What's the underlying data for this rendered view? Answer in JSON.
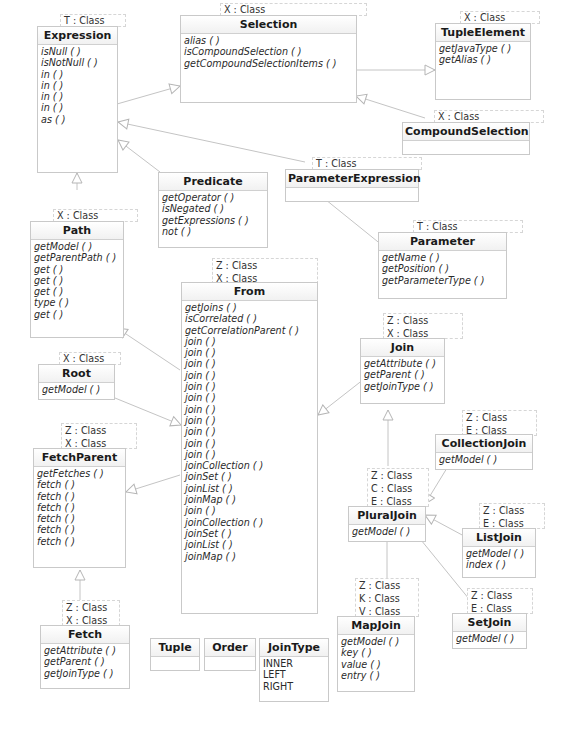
{
  "diagram": {
    "type": "UML class diagram",
    "classes": {
      "expression": {
        "name": "Expression",
        "type_params": [
          "T : Class"
        ],
        "operations": [
          "isNull ( )",
          "isNotNull ( )",
          "in ( )",
          "in ( )",
          "in ( )",
          "in ( )",
          "as ( )"
        ]
      },
      "selection": {
        "name": "Selection",
        "type_params": [
          "X : Class"
        ],
        "operations": [
          "alias ( )",
          "isCompoundSelection ( )",
          "getCompoundSelectionItems ( )"
        ]
      },
      "tuple_element": {
        "name": "TupleElement",
        "type_params": [
          "X : Class"
        ],
        "operations": [
          "getJavaType ( )",
          "getAlias ( )"
        ]
      },
      "compound_selection": {
        "name": "CompoundSelection",
        "type_params": [
          "X : Class"
        ],
        "operations": []
      },
      "parameter_expression": {
        "name": "ParameterExpression",
        "type_params": [
          "T : Class"
        ],
        "operations": []
      },
      "predicate": {
        "name": "Predicate",
        "type_params": [],
        "operations": [
          "getOperator ( )",
          "isNegated ( )",
          "getExpressions ( )",
          "not ( )"
        ]
      },
      "parameter": {
        "name": "Parameter",
        "type_params": [
          "T : Class"
        ],
        "operations": [
          "getName ( )",
          "getPosition ( )",
          "getParameterType ( )"
        ]
      },
      "path": {
        "name": "Path",
        "type_params": [
          "X : Class"
        ],
        "operations": [
          "getModel ( )",
          "getParentPath ( )",
          "get ( )",
          "get ( )",
          "get ( )",
          "type ( )",
          "get ( )"
        ]
      },
      "from": {
        "name": "From",
        "type_params": [
          "Z : Class",
          "X : Class"
        ],
        "operations": [
          "getJoins ( )",
          "isCorrelated ( )",
          "getCorrelationParent ( )",
          "join ( )",
          "join ( )",
          "join ( )",
          "join ( )",
          "join ( )",
          "join ( )",
          "join ( )",
          "join ( )",
          "join ( )",
          "join ( )",
          "join ( )",
          "joinCollection ( )",
          "joinSet ( )",
          "joinList ( )",
          "joinMap ( )",
          "join ( )",
          "joinCollection ( )",
          "joinSet ( )",
          "joinList ( )",
          "joinMap ( )"
        ]
      },
      "join": {
        "name": "Join",
        "type_params": [
          "Z : Class",
          "X : Class"
        ],
        "operations": [
          "getAttribute ( )",
          "getParent ( )",
          "getJoinType ( )"
        ]
      },
      "root": {
        "name": "Root",
        "type_params": [
          "X : Class"
        ],
        "operations": [
          "getModel ( )"
        ]
      },
      "collection_join": {
        "name": "CollectionJoin",
        "type_params": [
          "Z : Class",
          "E : Class"
        ],
        "operations": [
          "getModel ( )"
        ]
      },
      "fetch_parent": {
        "name": "FetchParent",
        "type_params": [
          "Z : Class",
          "X : Class"
        ],
        "operations": [
          "getFetches ( )",
          "fetch ( )",
          "fetch ( )",
          "fetch ( )",
          "fetch ( )",
          "fetch ( )",
          "fetch ( )"
        ]
      },
      "plural_join": {
        "name": "PluralJoin",
        "type_params": [
          "Z : Class",
          "C : Class",
          "E : Class"
        ],
        "operations": [
          "getModel ( )"
        ]
      },
      "list_join": {
        "name": "ListJoin",
        "type_params": [
          "Z : Class",
          "E : Class"
        ],
        "operations": [
          "getModel ( )",
          "index ( )"
        ]
      },
      "set_join": {
        "name": "SetJoin",
        "type_params": [
          "Z : Class",
          "E : Class"
        ],
        "operations": [
          "getModel ( )"
        ]
      },
      "map_join": {
        "name": "MapJoin",
        "type_params": [
          "Z : Class",
          "K : Class",
          "V : Class"
        ],
        "operations": [
          "getModel ( )",
          "key ( )",
          "value ( )",
          "entry ( )"
        ]
      },
      "fetch": {
        "name": "Fetch",
        "type_params": [
          "Z : Class",
          "X : Class"
        ],
        "operations": [
          "getAttribute ( )",
          "getParent ( )",
          "getJoinType ( )"
        ]
      },
      "tuple": {
        "name": "Tuple",
        "type_params": [],
        "operations": []
      },
      "order": {
        "name": "Order",
        "type_params": [],
        "operations": []
      },
      "join_type": {
        "name": "JoinType",
        "type_params": [],
        "literals": [
          "INNER",
          "LEFT",
          "RIGHT"
        ]
      }
    },
    "generalizations": [
      [
        "Expression",
        "Selection"
      ],
      [
        "Selection",
        "TupleElement"
      ],
      [
        "CompoundSelection",
        "Selection"
      ],
      [
        "Predicate",
        "Expression"
      ],
      [
        "ParameterExpression",
        "Expression"
      ],
      [
        "ParameterExpression",
        "Parameter"
      ],
      [
        "Path",
        "Expression"
      ],
      [
        "From",
        "Path"
      ],
      [
        "Root",
        "From"
      ],
      [
        "From",
        "FetchParent"
      ],
      [
        "Join",
        "From"
      ],
      [
        "CollectionJoin",
        "PluralJoin"
      ],
      [
        "PluralJoin",
        "Join"
      ],
      [
        "ListJoin",
        "PluralJoin"
      ],
      [
        "SetJoin",
        "PluralJoin"
      ],
      [
        "MapJoin",
        "PluralJoin"
      ],
      [
        "Fetch",
        "FetchParent"
      ]
    ],
    "colors": {
      "border": "#c9c9c9",
      "edge": "#bdbdbd",
      "text": "#1a1a1a",
      "background": "#ffffff"
    }
  }
}
